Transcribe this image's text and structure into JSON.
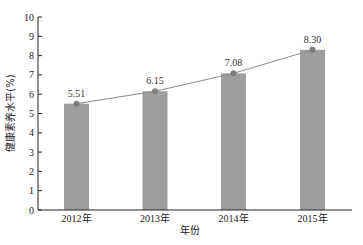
{
  "chart_data": {
    "type": "bar",
    "title": "",
    "xlabel": "年份",
    "ylabel": "健康素养水平(%)",
    "categories": [
      "2012年",
      "2013年",
      "2014年",
      "2015年"
    ],
    "values": [
      5.51,
      6.15,
      7.08,
      8.3
    ],
    "value_labels": [
      "5.51",
      "6.15",
      "7.08",
      "8.30"
    ],
    "series": [
      {
        "name": "bar",
        "type": "bar",
        "values": [
          5.51,
          6.15,
          7.08,
          8.3
        ],
        "color": "#9e9e9e"
      },
      {
        "name": "trend",
        "type": "line",
        "values": [
          5.51,
          6.15,
          7.08,
          8.3
        ],
        "color": "#8a8a8a"
      }
    ],
    "yticks": [
      "0",
      "1",
      "2",
      "3",
      "4",
      "5",
      "6",
      "7",
      "8",
      "9",
      "10"
    ],
    "ylim": [
      0,
      10
    ],
    "grid": false,
    "legend": "none"
  }
}
